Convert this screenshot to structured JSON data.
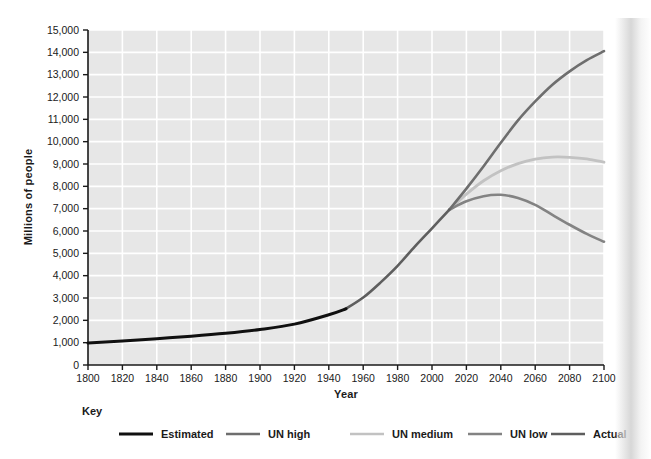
{
  "chart_data": {
    "type": "line",
    "title": "",
    "xlabel": "Year",
    "ylabel": "Millions of people",
    "xlim": [
      1800,
      2100
    ],
    "ylim": [
      0,
      15000
    ],
    "grid": true,
    "legend_position": "bottom",
    "legend_title": "Key",
    "xticks": [
      "1800",
      "1820",
      "1840",
      "1860",
      "1880",
      "1900",
      "1920",
      "1940",
      "1960",
      "1980",
      "2000",
      "2020",
      "2040",
      "2060",
      "2080",
      "2100"
    ],
    "yticks": [
      "0",
      "1,000",
      "2,000",
      "3,000",
      "4,000",
      "5,000",
      "6,000",
      "7,000",
      "8,000",
      "9,000",
      "10,000",
      "11,000",
      "12,000",
      "13,000",
      "14,000",
      "15,000"
    ],
    "series": [
      {
        "name": "Estimated",
        "color": "#101010",
        "width": 3.0,
        "x": [
          1800,
          1820,
          1840,
          1860,
          1880,
          1900,
          1920,
          1940,
          1950
        ],
        "values": [
          980,
          1080,
          1180,
          1290,
          1420,
          1590,
          1830,
          2250,
          2520
        ]
      },
      {
        "name": "Actual",
        "color": "#5e5e5e",
        "width": 2.6,
        "x": [
          1950,
          1960,
          1970,
          1980,
          1990,
          2000,
          2010
        ],
        "values": [
          2520,
          3020,
          3690,
          4440,
          5300,
          6120,
          6950
        ]
      },
      {
        "name": "UN high",
        "color": "#6e6e6e",
        "width": 2.6,
        "x": [
          2010,
          2020,
          2030,
          2040,
          2050,
          2060,
          2070,
          2080,
          2090,
          2100
        ],
        "values": [
          6950,
          7900,
          8900,
          9950,
          10950,
          11800,
          12550,
          13150,
          13650,
          14050
        ]
      },
      {
        "name": "UN medium",
        "color": "#c2c2c2",
        "width": 2.8,
        "x": [
          2010,
          2020,
          2030,
          2040,
          2050,
          2060,
          2070,
          2080,
          2090,
          2100
        ],
        "values": [
          6950,
          7650,
          8250,
          8700,
          9020,
          9220,
          9310,
          9300,
          9230,
          9080
        ]
      },
      {
        "name": "UN low",
        "color": "#838383",
        "width": 2.6,
        "x": [
          2010,
          2020,
          2030,
          2040,
          2050,
          2060,
          2070,
          2080,
          2090,
          2100
        ],
        "values": [
          6950,
          7330,
          7560,
          7620,
          7480,
          7170,
          6720,
          6280,
          5870,
          5520
        ]
      }
    ]
  },
  "axes": {
    "y_title": "Millions of people",
    "x_title": "Year"
  },
  "legend": {
    "title": "Key",
    "items": [
      {
        "label": "Estimated",
        "color": "#101010"
      },
      {
        "label": "UN high",
        "color": "#6e6e6e"
      },
      {
        "label": "UN medium",
        "color": "#c2c2c2"
      },
      {
        "label": "UN low",
        "color": "#838383"
      },
      {
        "label": "Actual",
        "color": "#5e5e5e"
      }
    ]
  },
  "colors": {
    "plot_background": "#e7e7e7",
    "gridline": "#ffffff",
    "axis": "#1a1a1a",
    "page_background": "#ffffff"
  }
}
